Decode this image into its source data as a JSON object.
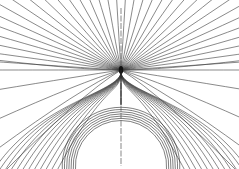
{
  "diagram": {
    "type": "field-lines",
    "width": 239,
    "height": 169,
    "singular_point": {
      "x": 121,
      "y": 70
    },
    "body": {
      "cx": 121,
      "cy": 166,
      "r": 44
    },
    "axis_x": 121,
    "line_color": "#3a3a3a",
    "background": "#ffffff",
    "n_radial_lines": 36,
    "n_wrap_lines": 7
  }
}
